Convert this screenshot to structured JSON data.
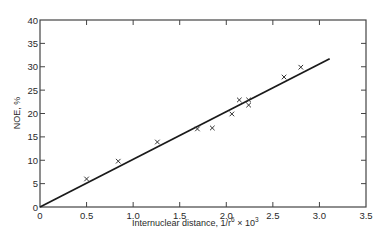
{
  "chart_data": {
    "type": "scatter",
    "title": "",
    "xlabel": "Internuclear distance, 1/r⁶ × 10³",
    "ylabel": "NOE, %",
    "xlim": [
      0,
      3.5
    ],
    "ylim": [
      0,
      40
    ],
    "x_ticks": [
      "0",
      "0.5",
      "1.0",
      "1.5",
      "2.0",
      "2.5",
      "3.0",
      "3.5"
    ],
    "y_ticks": [
      "0",
      "5",
      "10",
      "15",
      "20",
      "25",
      "30",
      "35",
      "40"
    ],
    "grid": false,
    "legend": null,
    "marker": "x",
    "series": [
      {
        "name": "observed",
        "x": [
          0.5,
          0.84,
          1.26,
          1.69,
          1.85,
          2.06,
          2.14,
          2.24,
          2.24,
          2.62,
          2.8
        ],
        "y": [
          6.0,
          9.8,
          13.9,
          16.7,
          16.9,
          19.9,
          22.9,
          22.9,
          21.8,
          27.8,
          29.9
        ]
      }
    ],
    "fit_line": {
      "x": [
        0,
        3.11
      ],
      "y": [
        0,
        31.7
      ]
    }
  },
  "axes": {
    "x_title_main": "Internuclear distance, 1/r",
    "x_title_sup1": "6",
    "x_title_mid": " × 10",
    "x_title_sup2": "3",
    "y_title": "NOE, %"
  }
}
